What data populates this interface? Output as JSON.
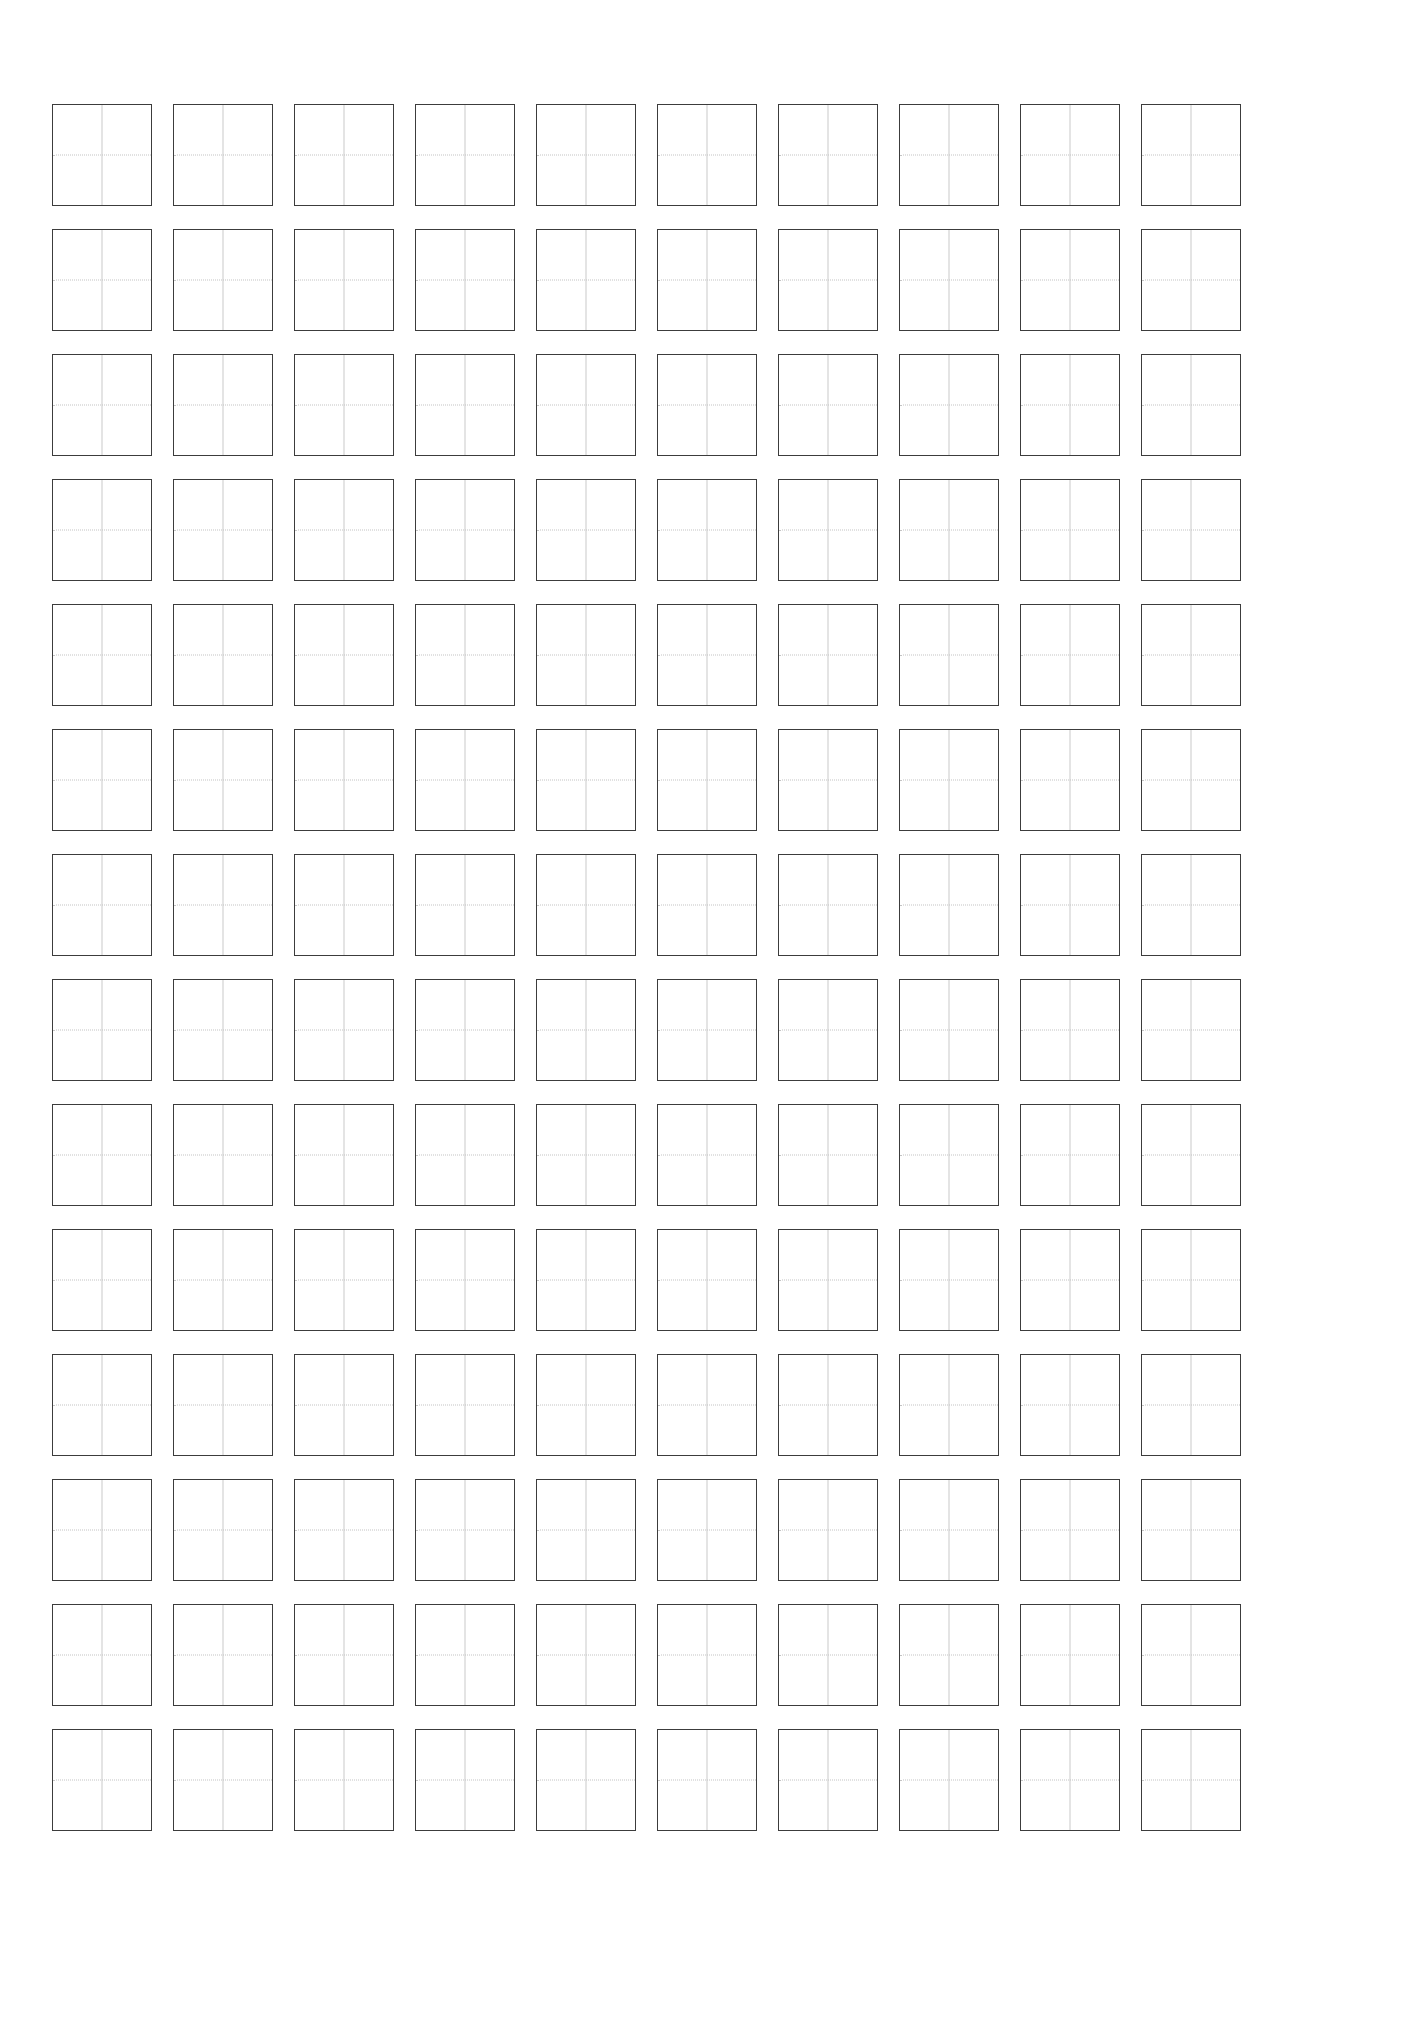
{
  "document": {
    "kind": "practice-grid-worksheet",
    "title": "",
    "page_background": "#ffffff",
    "page_width": 1406,
    "page_height": 2033
  },
  "sheet": {
    "rows": 14,
    "columns": 10,
    "total_cells": 140,
    "cell_width": 100,
    "cell_height": 102,
    "column_gap": 21,
    "row_gap": 23,
    "origin_x": 52,
    "origin_y": 104
  },
  "colors": {
    "cell_border": "#3c3c3c",
    "vertical_guide": "#c9c9c9",
    "horizontal_guide": "#c4c4c4",
    "page": "#ffffff",
    "glyph": "#c9c9c9"
  },
  "cell": {
    "border_style": "solid",
    "border_width": "1.6px",
    "vertical_guide_style": "solid",
    "horizontal_guide_style": "dotted",
    "content": ""
  },
  "cells": [
    {
      "row": 1,
      "col": 1,
      "text": ""
    },
    {
      "row": 1,
      "col": 2,
      "text": ""
    },
    {
      "row": 1,
      "col": 3,
      "text": ""
    },
    {
      "row": 1,
      "col": 4,
      "text": ""
    },
    {
      "row": 1,
      "col": 5,
      "text": ""
    },
    {
      "row": 1,
      "col": 6,
      "text": ""
    },
    {
      "row": 1,
      "col": 7,
      "text": ""
    },
    {
      "row": 1,
      "col": 8,
      "text": ""
    },
    {
      "row": 1,
      "col": 9,
      "text": ""
    },
    {
      "row": 1,
      "col": 10,
      "text": ""
    },
    {
      "row": 2,
      "col": 1,
      "text": ""
    },
    {
      "row": 2,
      "col": 2,
      "text": ""
    },
    {
      "row": 2,
      "col": 3,
      "text": ""
    },
    {
      "row": 2,
      "col": 4,
      "text": ""
    },
    {
      "row": 2,
      "col": 5,
      "text": ""
    },
    {
      "row": 2,
      "col": 6,
      "text": ""
    },
    {
      "row": 2,
      "col": 7,
      "text": ""
    },
    {
      "row": 2,
      "col": 8,
      "text": ""
    },
    {
      "row": 2,
      "col": 9,
      "text": ""
    },
    {
      "row": 2,
      "col": 10,
      "text": ""
    },
    {
      "row": 3,
      "col": 1,
      "text": ""
    },
    {
      "row": 3,
      "col": 2,
      "text": ""
    },
    {
      "row": 3,
      "col": 3,
      "text": ""
    },
    {
      "row": 3,
      "col": 4,
      "text": ""
    },
    {
      "row": 3,
      "col": 5,
      "text": ""
    },
    {
      "row": 3,
      "col": 6,
      "text": ""
    },
    {
      "row": 3,
      "col": 7,
      "text": ""
    },
    {
      "row": 3,
      "col": 8,
      "text": ""
    },
    {
      "row": 3,
      "col": 9,
      "text": ""
    },
    {
      "row": 3,
      "col": 10,
      "text": ""
    },
    {
      "row": 4,
      "col": 1,
      "text": ""
    },
    {
      "row": 4,
      "col": 2,
      "text": ""
    },
    {
      "row": 4,
      "col": 3,
      "text": ""
    },
    {
      "row": 4,
      "col": 4,
      "text": ""
    },
    {
      "row": 4,
      "col": 5,
      "text": ""
    },
    {
      "row": 4,
      "col": 6,
      "text": ""
    },
    {
      "row": 4,
      "col": 7,
      "text": ""
    },
    {
      "row": 4,
      "col": 8,
      "text": ""
    },
    {
      "row": 4,
      "col": 9,
      "text": ""
    },
    {
      "row": 4,
      "col": 10,
      "text": ""
    },
    {
      "row": 5,
      "col": 1,
      "text": ""
    },
    {
      "row": 5,
      "col": 2,
      "text": ""
    },
    {
      "row": 5,
      "col": 3,
      "text": ""
    },
    {
      "row": 5,
      "col": 4,
      "text": ""
    },
    {
      "row": 5,
      "col": 5,
      "text": ""
    },
    {
      "row": 5,
      "col": 6,
      "text": ""
    },
    {
      "row": 5,
      "col": 7,
      "text": ""
    },
    {
      "row": 5,
      "col": 8,
      "text": ""
    },
    {
      "row": 5,
      "col": 9,
      "text": ""
    },
    {
      "row": 5,
      "col": 10,
      "text": ""
    },
    {
      "row": 6,
      "col": 1,
      "text": ""
    },
    {
      "row": 6,
      "col": 2,
      "text": ""
    },
    {
      "row": 6,
      "col": 3,
      "text": ""
    },
    {
      "row": 6,
      "col": 4,
      "text": ""
    },
    {
      "row": 6,
      "col": 5,
      "text": ""
    },
    {
      "row": 6,
      "col": 6,
      "text": ""
    },
    {
      "row": 6,
      "col": 7,
      "text": ""
    },
    {
      "row": 6,
      "col": 8,
      "text": ""
    },
    {
      "row": 6,
      "col": 9,
      "text": ""
    },
    {
      "row": 6,
      "col": 10,
      "text": ""
    },
    {
      "row": 7,
      "col": 1,
      "text": ""
    },
    {
      "row": 7,
      "col": 2,
      "text": ""
    },
    {
      "row": 7,
      "col": 3,
      "text": ""
    },
    {
      "row": 7,
      "col": 4,
      "text": ""
    },
    {
      "row": 7,
      "col": 5,
      "text": ""
    },
    {
      "row": 7,
      "col": 6,
      "text": ""
    },
    {
      "row": 7,
      "col": 7,
      "text": ""
    },
    {
      "row": 7,
      "col": 8,
      "text": ""
    },
    {
      "row": 7,
      "col": 9,
      "text": ""
    },
    {
      "row": 7,
      "col": 10,
      "text": ""
    },
    {
      "row": 8,
      "col": 1,
      "text": ""
    },
    {
      "row": 8,
      "col": 2,
      "text": ""
    },
    {
      "row": 8,
      "col": 3,
      "text": ""
    },
    {
      "row": 8,
      "col": 4,
      "text": ""
    },
    {
      "row": 8,
      "col": 5,
      "text": ""
    },
    {
      "row": 8,
      "col": 6,
      "text": ""
    },
    {
      "row": 8,
      "col": 7,
      "text": ""
    },
    {
      "row": 8,
      "col": 8,
      "text": ""
    },
    {
      "row": 8,
      "col": 9,
      "text": ""
    },
    {
      "row": 8,
      "col": 10,
      "text": ""
    },
    {
      "row": 9,
      "col": 1,
      "text": ""
    },
    {
      "row": 9,
      "col": 2,
      "text": ""
    },
    {
      "row": 9,
      "col": 3,
      "text": ""
    },
    {
      "row": 9,
      "col": 4,
      "text": ""
    },
    {
      "row": 9,
      "col": 5,
      "text": ""
    },
    {
      "row": 9,
      "col": 6,
      "text": ""
    },
    {
      "row": 9,
      "col": 7,
      "text": ""
    },
    {
      "row": 9,
      "col": 8,
      "text": ""
    },
    {
      "row": 9,
      "col": 9,
      "text": ""
    },
    {
      "row": 9,
      "col": 10,
      "text": ""
    },
    {
      "row": 10,
      "col": 1,
      "text": ""
    },
    {
      "row": 10,
      "col": 2,
      "text": ""
    },
    {
      "row": 10,
      "col": 3,
      "text": ""
    },
    {
      "row": 10,
      "col": 4,
      "text": ""
    },
    {
      "row": 10,
      "col": 5,
      "text": ""
    },
    {
      "row": 10,
      "col": 6,
      "text": ""
    },
    {
      "row": 10,
      "col": 7,
      "text": ""
    },
    {
      "row": 10,
      "col": 8,
      "text": ""
    },
    {
      "row": 10,
      "col": 9,
      "text": ""
    },
    {
      "row": 10,
      "col": 10,
      "text": ""
    },
    {
      "row": 11,
      "col": 1,
      "text": ""
    },
    {
      "row": 11,
      "col": 2,
      "text": ""
    },
    {
      "row": 11,
      "col": 3,
      "text": ""
    },
    {
      "row": 11,
      "col": 4,
      "text": ""
    },
    {
      "row": 11,
      "col": 5,
      "text": ""
    },
    {
      "row": 11,
      "col": 6,
      "text": ""
    },
    {
      "row": 11,
      "col": 7,
      "text": ""
    },
    {
      "row": 11,
      "col": 8,
      "text": ""
    },
    {
      "row": 11,
      "col": 9,
      "text": ""
    },
    {
      "row": 11,
      "col": 10,
      "text": ""
    },
    {
      "row": 12,
      "col": 1,
      "text": ""
    },
    {
      "row": 12,
      "col": 2,
      "text": ""
    },
    {
      "row": 12,
      "col": 3,
      "text": ""
    },
    {
      "row": 12,
      "col": 4,
      "text": ""
    },
    {
      "row": 12,
      "col": 5,
      "text": ""
    },
    {
      "row": 12,
      "col": 6,
      "text": ""
    },
    {
      "row": 12,
      "col": 7,
      "text": ""
    },
    {
      "row": 12,
      "col": 8,
      "text": ""
    },
    {
      "row": 12,
      "col": 9,
      "text": ""
    },
    {
      "row": 12,
      "col": 10,
      "text": ""
    },
    {
      "row": 13,
      "col": 1,
      "text": ""
    },
    {
      "row": 13,
      "col": 2,
      "text": ""
    },
    {
      "row": 13,
      "col": 3,
      "text": ""
    },
    {
      "row": 13,
      "col": 4,
      "text": ""
    },
    {
      "row": 13,
      "col": 5,
      "text": ""
    },
    {
      "row": 13,
      "col": 6,
      "text": ""
    },
    {
      "row": 13,
      "col": 7,
      "text": ""
    },
    {
      "row": 13,
      "col": 8,
      "text": ""
    },
    {
      "row": 13,
      "col": 9,
      "text": ""
    },
    {
      "row": 13,
      "col": 10,
      "text": ""
    },
    {
      "row": 14,
      "col": 1,
      "text": ""
    },
    {
      "row": 14,
      "col": 2,
      "text": ""
    },
    {
      "row": 14,
      "col": 3,
      "text": ""
    },
    {
      "row": 14,
      "col": 4,
      "text": ""
    },
    {
      "row": 14,
      "col": 5,
      "text": ""
    },
    {
      "row": 14,
      "col": 6,
      "text": ""
    },
    {
      "row": 14,
      "col": 7,
      "text": ""
    },
    {
      "row": 14,
      "col": 8,
      "text": ""
    },
    {
      "row": 14,
      "col": 9,
      "text": ""
    },
    {
      "row": 14,
      "col": 10,
      "text": ""
    }
  ]
}
